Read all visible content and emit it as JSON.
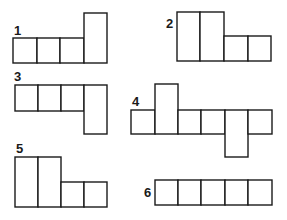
{
  "figures": [
    {
      "label": "1",
      "description": "three squares in a row with a double-height rectangle standing up on the right end"
    },
    {
      "label": "2",
      "description": "two double-height rectangles followed by two squares in a row"
    },
    {
      "label": "3",
      "description": "three squares in a row with a double-height rectangle hanging down on the right end"
    },
    {
      "label": "4",
      "description": "row of six units; second is double-height extending up, fifth is double-height extending down"
    },
    {
      "label": "5",
      "description": "two double-height rectangles followed by two squares in a row"
    },
    {
      "label": "6",
      "description": "five squares in a straight row"
    }
  ]
}
